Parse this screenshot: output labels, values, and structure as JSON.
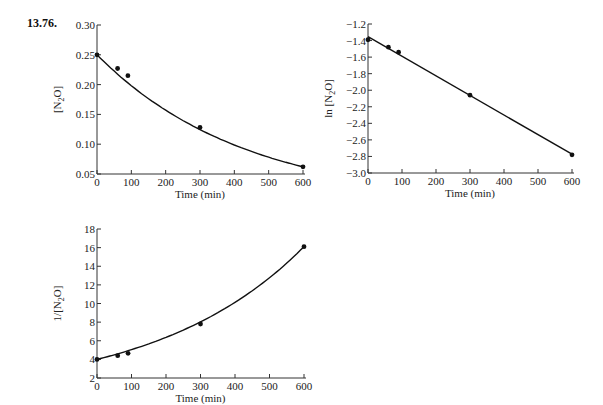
{
  "problem_label": "13.76.",
  "chart_data": [
    {
      "type": "scatter",
      "title": "",
      "xlabel": "Time (min)",
      "ylabel": "[N2O]",
      "ylabel_parts": {
        "pre": "[N",
        "sub": "2",
        "post": "O]"
      },
      "xlim": [
        0,
        600
      ],
      "ylim": [
        0.05,
        0.3
      ],
      "xticks": [
        0,
        100,
        200,
        300,
        400,
        500,
        600
      ],
      "yticks": [
        0.05,
        0.1,
        0.15,
        0.2,
        0.25,
        0.3
      ],
      "ytick_labels": [
        "0.05",
        "0.10",
        "0.15",
        "0.20",
        "0.25",
        "0.30"
      ],
      "x": [
        0,
        60,
        90,
        300,
        600
      ],
      "values": [
        0.25,
        0.227,
        0.215,
        0.128,
        0.062
      ],
      "fit": "curve",
      "grid": false
    },
    {
      "type": "scatter",
      "title": "",
      "xlabel": "Time (min)",
      "ylabel": "ln [N2O]",
      "ylabel_parts": {
        "pre": "ln [N",
        "sub": "2",
        "post": "O]"
      },
      "xlim": [
        0,
        600
      ],
      "ylim": [
        -3.0,
        -1.2
      ],
      "xticks": [
        0,
        100,
        200,
        300,
        400,
        500,
        600
      ],
      "yticks": [
        -1.2,
        -1.4,
        -1.6,
        -1.8,
        -2.0,
        -2.2,
        -2.4,
        -2.6,
        -2.8,
        -3.0
      ],
      "ytick_labels": [
        "−1.2",
        "−1.4",
        "−1.6",
        "−1.8",
        "−2.0",
        "−2.2",
        "−2.4",
        "−2.6",
        "−2.8",
        "−3.0"
      ],
      "x": [
        0,
        60,
        90,
        300,
        600
      ],
      "values": [
        -1.39,
        -1.48,
        -1.54,
        -2.06,
        -2.78
      ],
      "fit": "linear",
      "grid": false
    },
    {
      "type": "scatter",
      "title": "",
      "xlabel": "Time (min)",
      "ylabel": "1/[N2O]",
      "ylabel_parts": {
        "pre": "1/[N",
        "sub": "2",
        "post": "O]"
      },
      "xlim": [
        0,
        600
      ],
      "ylim": [
        2,
        18
      ],
      "xticks": [
        0,
        100,
        200,
        300,
        400,
        500,
        600
      ],
      "yticks": [
        2,
        4,
        6,
        8,
        10,
        12,
        14,
        16,
        18
      ],
      "ytick_labels": [
        "2",
        "4",
        "6",
        "8",
        "10",
        "12",
        "14",
        "16",
        "18"
      ],
      "x": [
        0,
        60,
        90,
        300,
        600
      ],
      "values": [
        4.0,
        4.4,
        4.65,
        7.8,
        16.1
      ],
      "fit": "curve",
      "grid": false
    }
  ]
}
